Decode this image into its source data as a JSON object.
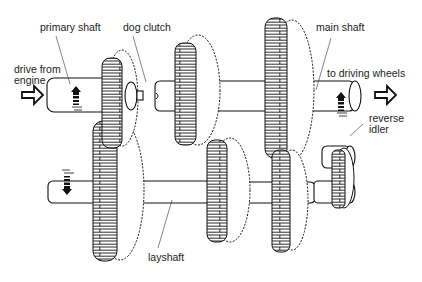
{
  "diagram": {
    "labels": {
      "primary_shaft": "primary shaft",
      "dog_clutch": "dog clutch",
      "main_shaft": "main shaft",
      "drive_from_engine_1": "drive from",
      "drive_from_engine_2": "engine",
      "to_driving_wheels": "to driving wheels",
      "reverse_idler_1": "reverse",
      "reverse_idler_2": "idler",
      "layshaft": "layshaft"
    },
    "components": [
      {
        "name": "primary shaft",
        "role": "input shaft from engine"
      },
      {
        "name": "dog clutch",
        "role": "couples primary shaft to main shaft"
      },
      {
        "name": "main shaft",
        "role": "output shaft to driving wheels"
      },
      {
        "name": "layshaft",
        "role": "countershaft carrying gears"
      },
      {
        "name": "reverse idler",
        "role": "idler gear for reverse"
      }
    ],
    "arrows": [
      {
        "name": "input-arrow",
        "direction": "right",
        "meaning": "drive from engine"
      },
      {
        "name": "output-arrow",
        "direction": "right",
        "meaning": "to driving wheels"
      },
      {
        "name": "primary-rotation",
        "direction": "up"
      },
      {
        "name": "main-rotation",
        "direction": "up"
      },
      {
        "name": "layshaft-rotation",
        "direction": "down"
      }
    ],
    "colors": {
      "ink": "#111111",
      "background": "#ffffff",
      "text": "#222222"
    }
  }
}
